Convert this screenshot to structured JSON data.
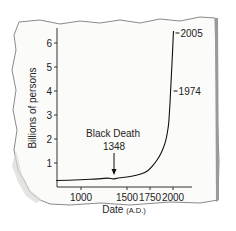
{
  "chart_data": {
    "type": "line",
    "title": "",
    "xlabel": "Date",
    "xlabel_suffix": "(A.D.)",
    "ylabel": "Billions of persons",
    "x_ticks": [
      1000,
      1500,
      1750,
      2000
    ],
    "x_tick_labels": [
      "1000",
      "1500",
      "1750",
      "2000"
    ],
    "y_ticks": [
      1,
      2,
      3,
      4,
      5,
      6
    ],
    "y_tick_labels": [
      "1",
      "2",
      "3",
      "4",
      "5",
      "6"
    ],
    "xlim": [
      730,
      2130
    ],
    "ylim": [
      0,
      6.5
    ],
    "grid": false,
    "legend": null,
    "series": [
      {
        "name": "World population",
        "x": [
          730,
          1000,
          1200,
          1300,
          1348,
          1400,
          1500,
          1600,
          1700,
          1750,
          1800,
          1850,
          1900,
          1927,
          1950,
          1960,
          1974,
          1987,
          1999,
          2005
        ],
        "values": [
          0.27,
          0.3,
          0.34,
          0.38,
          0.33,
          0.37,
          0.42,
          0.48,
          0.6,
          0.75,
          0.98,
          1.25,
          1.65,
          2.0,
          2.5,
          3.0,
          4.0,
          5.0,
          6.0,
          6.5
        ]
      }
    ],
    "annotations": [
      {
        "text": "Black Death",
        "subtext": "1348",
        "x": 1348,
        "y": 0.33,
        "type": "arrow"
      },
      {
        "text": "1974",
        "x": 1974,
        "y": 4.0,
        "type": "tick-label"
      },
      {
        "text": "2005",
        "x": 2005,
        "y": 6.5,
        "type": "tick-label"
      }
    ]
  },
  "labels": {
    "ylabel": "Billions of persons",
    "xlabel": "Date",
    "xlabel_suffix": "(A.D.)",
    "annotation_black_death": "Black Death",
    "annotation_black_death_year": "1348",
    "annotation_1974": "1974",
    "annotation_2005": "2005"
  }
}
